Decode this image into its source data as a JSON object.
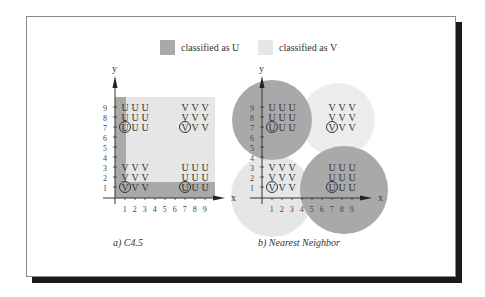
{
  "legend": {
    "items": [
      {
        "label": "classified as U",
        "color": "#a9a9a9"
      },
      {
        "label": "classified as V",
        "color": "#e6e6e6"
      }
    ]
  },
  "panels": [
    {
      "caption": "a) C4.5",
      "x_label": "x",
      "y_label": "y",
      "x_ticks": [
        "1",
        "2",
        "3",
        "4",
        "5",
        "6",
        "7",
        "8",
        "9"
      ],
      "y_ticks": [
        "1",
        "2",
        "3",
        "4",
        "5",
        "6",
        "7",
        "8",
        "9"
      ],
      "clusters": [
        {
          "position": "top-left",
          "rows": [
            [
              "U",
              "U",
              "U"
            ],
            [
              "U",
              "U",
              "U"
            ],
            [
              "U",
              "U",
              "U"
            ]
          ],
          "circled": "U"
        },
        {
          "position": "top-right",
          "rows": [
            [
              "V",
              "V",
              "V"
            ],
            [
              "V",
              "V",
              "V"
            ],
            [
              "V",
              "V",
              "V"
            ]
          ],
          "circled": "V"
        },
        {
          "position": "bottom-left",
          "rows": [
            [
              "V",
              "V",
              "V"
            ],
            [
              "V",
              "V",
              "V"
            ],
            [
              "V",
              "V",
              "V"
            ]
          ],
          "circled": "V"
        },
        {
          "position": "bottom-right",
          "rows": [
            [
              "U",
              "U",
              "U"
            ],
            [
              "U",
              "U",
              "U"
            ],
            [
              "U",
              "U",
              "U"
            ]
          ],
          "circled": "U"
        }
      ]
    },
    {
      "caption": "b) Nearest Neighbor",
      "x_label": "x",
      "y_label": "y",
      "x_ticks": [
        "1",
        "2",
        "3",
        "4",
        "5",
        "6",
        "7",
        "8",
        "9"
      ],
      "y_ticks": [
        "1",
        "2",
        "3",
        "4",
        "5",
        "6",
        "7",
        "8",
        "9"
      ],
      "clusters": [
        {
          "position": "top-left",
          "rows": [
            [
              "U",
              "U",
              "U"
            ],
            [
              "U",
              "U",
              "U"
            ],
            [
              "U",
              "U",
              "U"
            ]
          ],
          "circled": "U"
        },
        {
          "position": "top-right",
          "rows": [
            [
              "V",
              "V",
              "V"
            ],
            [
              "V",
              "V",
              "V"
            ],
            [
              "V",
              "V",
              "V"
            ]
          ],
          "circled": "V"
        },
        {
          "position": "bottom-left",
          "rows": [
            [
              "V",
              "V",
              "V"
            ],
            [
              "V",
              "V",
              "V"
            ],
            [
              "V",
              "V",
              "V"
            ]
          ],
          "circled": "V"
        },
        {
          "position": "bottom-right",
          "rows": [
            [
              "U",
              "U",
              "U"
            ],
            [
              "U",
              "U",
              "U"
            ],
            [
              "U",
              "U",
              "U"
            ]
          ],
          "circled": "U"
        }
      ]
    }
  ]
}
